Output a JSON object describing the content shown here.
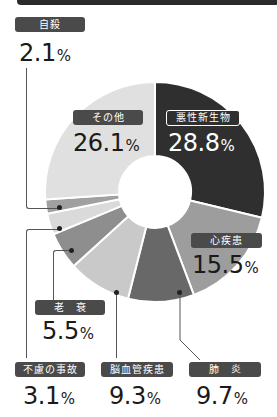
{
  "chart_data": {
    "type": "pie",
    "subtype": "donut",
    "title": "",
    "unit": "%",
    "categories": [
      "悪性新生物",
      "心疾患",
      "肺炎",
      "脳血管疾患",
      "老衰",
      "不慮の事故",
      "自殺",
      "その他"
    ],
    "values": [
      28.8,
      15.5,
      9.7,
      9.3,
      5.5,
      3.1,
      2.1,
      26.1
    ],
    "colors": [
      "#2f2f2f",
      "#9d9d9d",
      "#686868",
      "#c9c9c9",
      "#8e8e8e",
      "#dadada",
      "#a0a0a0",
      "#e0e0e0"
    ],
    "start_angle_deg": 0,
    "direction": "clockwise",
    "legend": "none (callout labels)"
  },
  "labels": {
    "malignant": {
      "name": "悪性新生物",
      "value": "28.8",
      "unit": "%"
    },
    "heart": {
      "name": "心疾患",
      "value": "15.5",
      "unit": "%"
    },
    "pneumonia": {
      "name": "肺　炎",
      "value": "9.7",
      "unit": "%"
    },
    "cerebro": {
      "name": "脳血管疾患",
      "value": "9.3",
      "unit": "%"
    },
    "senility": {
      "name": "老　衰",
      "value": "5.5",
      "unit": "%"
    },
    "accident": {
      "name": "不慮の事故",
      "value": "3.1",
      "unit": "%"
    },
    "suicide": {
      "name": "自殺",
      "value": "2.1",
      "unit": "%"
    },
    "other": {
      "name": "その他",
      "value": "26.1",
      "unit": "%"
    }
  }
}
